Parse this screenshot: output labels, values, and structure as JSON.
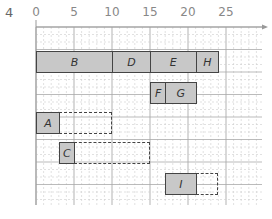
{
  "figure": {
    "label": "4",
    "axis": {
      "ticks": [
        "0",
        "5",
        "10",
        "15",
        "20",
        "25"
      ],
      "tick_values": [
        0,
        5,
        10,
        15,
        20,
        25
      ],
      "origin_px": 36,
      "unit_px": 7.6
    },
    "colors": {
      "box_fill": "#c8c8c8",
      "box_border": "#444444",
      "grid": "#bbbbbb"
    },
    "rows": [
      {
        "row": 1,
        "tasks": [
          {
            "label": "B",
            "start": 0,
            "end": 10
          },
          {
            "label": "D",
            "start": 10,
            "end": 15
          },
          {
            "label": "E",
            "start": 15,
            "end": 21
          },
          {
            "label": "H",
            "start": 21,
            "end": 24
          }
        ]
      },
      {
        "row": 2,
        "tasks": [
          {
            "label": "F",
            "start": 15,
            "end": 17
          },
          {
            "label": "G",
            "start": 17,
            "end": 21
          }
        ]
      },
      {
        "row": 3,
        "tasks": [
          {
            "label": "A",
            "start": 0,
            "end": 3,
            "float_end": 10
          }
        ]
      },
      {
        "row": 4,
        "tasks": [
          {
            "label": "C",
            "start": 3,
            "end": 5,
            "float_end": 15
          }
        ]
      },
      {
        "row": 5,
        "tasks": [
          {
            "label": "I",
            "start": 17,
            "end": 21,
            "float_end": 24
          }
        ]
      }
    ]
  }
}
